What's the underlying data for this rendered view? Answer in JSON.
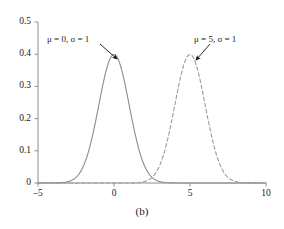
{
  "figure": {
    "caption": "(b)",
    "background_color": "#ffffff",
    "axis_color": "#808080",
    "text_color": "#1a1a1a"
  },
  "annotations": [
    {
      "name": "curve-label-left",
      "text": "μ = 0, σ = 1",
      "mu": 0,
      "sigma": 1,
      "x_px": 47,
      "y_px": 35,
      "arrow_from": [
        100,
        44
      ],
      "arrow_to": [
        117,
        59
      ]
    },
    {
      "name": "curve-label-right",
      "text": "μ = 5, σ = 1",
      "mu": 5,
      "sigma": 1,
      "x_px": 194,
      "y_px": 35,
      "arrow_from": [
        210,
        44
      ],
      "arrow_to": [
        196,
        60
      ]
    }
  ],
  "chart_data": {
    "type": "line",
    "title": "",
    "subtitle": "",
    "xlabel": "",
    "ylabel": "",
    "xlim": [
      -5,
      10
    ],
    "ylim": [
      0,
      0.5
    ],
    "xticks": [
      -5,
      0,
      5,
      10
    ],
    "xtick_labels": [
      "–5",
      "0",
      "5",
      "10"
    ],
    "yticks": [
      0,
      0.1,
      0.2,
      0.3,
      0.4,
      0.5
    ],
    "ytick_labels": [
      "0",
      "0.1",
      "0.2",
      "0.3",
      "0.4",
      "0.5"
    ],
    "grid": false,
    "legend": "none",
    "series": [
      {
        "name": "normal-mu0-sigma1",
        "label": "μ = 0, σ = 1",
        "distribution": "normal",
        "mu": 0,
        "sigma": 1,
        "peak_value": 0.399,
        "peak_x": 0,
        "linestyle": "solid",
        "color": "#8c8c8c",
        "linewidth": 1.1
      },
      {
        "name": "normal-mu5-sigma1",
        "label": "μ = 5, σ = 1",
        "distribution": "normal",
        "mu": 5,
        "sigma": 1,
        "peak_value": 0.399,
        "peak_x": 5,
        "linestyle": "dashed",
        "color": "#9a9a9a",
        "linewidth": 1.1
      }
    ]
  },
  "axes_px": {
    "x0_px": 38,
    "x1_px": 266,
    "y0_px": 183,
    "y1_px": 22
  }
}
